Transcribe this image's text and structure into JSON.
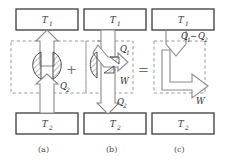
{
  "figure": {
    "caption_a": "(a)",
    "caption_b": "(b)",
    "caption_c": "(c)",
    "operator_plus": "+",
    "operator_equals": "=",
    "colors": {
      "box_stroke": "#3a3a3a",
      "arrow_stroke": "#8a8a8a",
      "dashed_stroke": "#9a9a9a",
      "text": "#2b2b2b",
      "caption": "#4a4a4a",
      "background": "#ffffff"
    },
    "panels": [
      {
        "id": "a",
        "caption": "(a)",
        "hot_reservoir": "T",
        "hot_reservoir_sub": "1",
        "cold_reservoir": "T",
        "cold_reservoir_sub": "2",
        "flow_label": "Q",
        "flow_label_sub": "2",
        "flow_direction": "up",
        "has_hatched_device": true,
        "has_dashed_boundary": true
      },
      {
        "id": "b",
        "caption": "(b)",
        "hot_reservoir": "T",
        "hot_reservoir_sub": "1",
        "cold_reservoir": "T",
        "cold_reservoir_sub": "2",
        "heat_in_label": "Q",
        "heat_in_label_sub": "1",
        "heat_out_label": "Q",
        "heat_out_label_sub": "2",
        "work_label": "W",
        "flow_direction": "down",
        "has_hatched_device": true,
        "has_dashed_boundary": true
      },
      {
        "id": "c",
        "caption": "(c)",
        "hot_reservoir": "T",
        "hot_reservoir_sub": "1",
        "cold_reservoir": "T",
        "cold_reservoir_sub": "2",
        "net_heat_label": "Q",
        "net_heat_label_sub": "1",
        "net_heat_minus": "−",
        "net_heat_label2": "Q",
        "net_heat_label2_sub": "2",
        "work_label": "W",
        "flow_direction": "down-right",
        "has_hatched_device": false,
        "has_dashed_boundary": true
      }
    ]
  }
}
